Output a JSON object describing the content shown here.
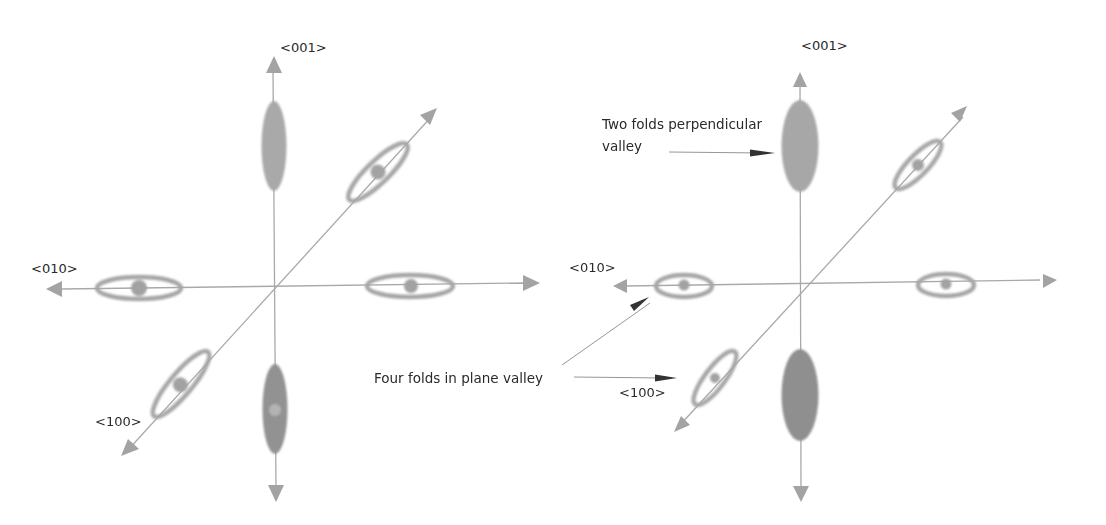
{
  "colors": {
    "axis": "#a9a9a9",
    "arrowhead": "#a3a3a3",
    "ellipse_ring": "#a6a6a6",
    "ellipse_fill_light": "#a9a9a9",
    "ellipse_fill_dark": "#8e8e8e",
    "pointer_arrow": "#333333",
    "text": "#2a2a2a"
  },
  "panels": [
    {
      "name": "left",
      "axis_labels": {
        "z_up": "<001>",
        "y_left": "<010>",
        "x_diag": "<100>"
      }
    },
    {
      "name": "right",
      "axis_labels": {
        "z_up": "<001>",
        "y_left": "<010>",
        "x_diag": "<100>"
      },
      "annotations": {
        "perpendicular": {
          "line1": "Two folds perpendicular",
          "line2": "valley"
        },
        "in_plane": "Four folds in plane valley"
      }
    }
  ]
}
